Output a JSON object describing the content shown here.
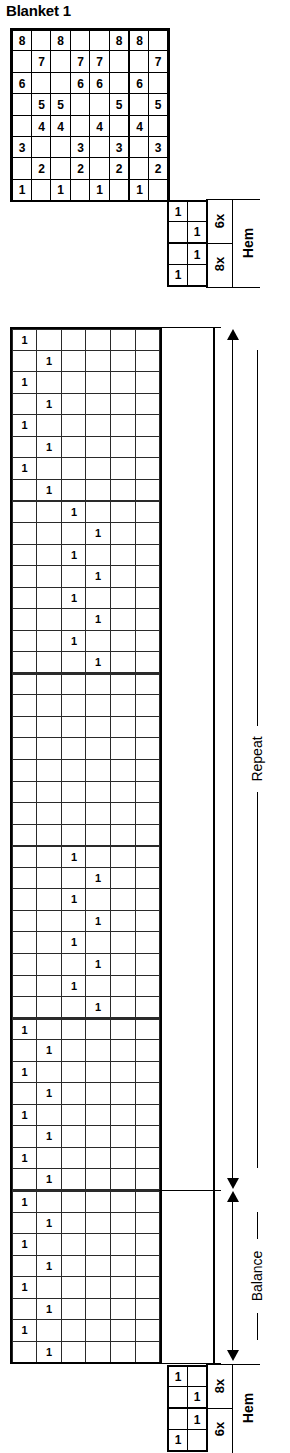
{
  "title": "Blanket 1",
  "colors": {
    "white": "#ffffff",
    "light_grey": "#cbcbcb",
    "dark_grey": "#6d6d6d",
    "black": "#1b1b1b",
    "line": "#000000"
  },
  "threading": {
    "name": "threading-draft",
    "columns": 8,
    "rows": 8,
    "shaft_labels": [
      "8",
      "7",
      "6",
      "5",
      "4",
      "3",
      "2",
      "1"
    ],
    "grid": [
      [
        "8",
        "",
        "8",
        "",
        "",
        "8",
        "8",
        ""
      ],
      [
        "",
        "7",
        "",
        "7",
        "7",
        "",
        "",
        "7"
      ],
      [
        "6",
        "",
        "",
        "6",
        "6",
        "",
        "6",
        ""
      ],
      [
        "",
        "5",
        "5",
        "",
        "",
        "5",
        "",
        "5"
      ],
      [
        "",
        "4",
        "4",
        "",
        "4",
        "",
        "4",
        ""
      ],
      [
        "3",
        "",
        "",
        "3",
        "",
        "3",
        "",
        "3"
      ],
      [
        "",
        "2",
        "",
        "2",
        "",
        "2",
        "",
        "2"
      ],
      [
        "1",
        "",
        "1",
        "",
        "1",
        "",
        "1",
        ""
      ]
    ]
  },
  "hem_top": {
    "name": "hem-top",
    "label": "Hem",
    "repeat_upper": "6x",
    "repeat_lower": "8x",
    "rows": [
      {
        "col7": "1",
        "col8": ""
      },
      {
        "col7": "",
        "col8": "1"
      },
      {
        "col7": "",
        "col8": "1"
      },
      {
        "col7": "1",
        "col8": ""
      }
    ]
  },
  "hem_bottom": {
    "name": "hem-bottom",
    "label": "Hem",
    "repeat_upper": "8x",
    "repeat_lower": "6x",
    "rows": [
      {
        "col7": "1",
        "col8": ""
      },
      {
        "col7": "",
        "col8": "1"
      },
      {
        "col7": "",
        "col8": "1"
      },
      {
        "col7": "1",
        "col8": ""
      }
    ]
  },
  "treadling": {
    "name": "treadling-draft",
    "columns": 6,
    "total_rows": 48,
    "repeat_label": "Repeat",
    "balance_label": "Balance",
    "repeat_rows": 40,
    "balance_rows": 8,
    "mark": "1",
    "blocks": [
      {
        "name": "block-1-light-grey",
        "color": "light_grey",
        "cols": [
          1,
          2
        ],
        "rows": 8,
        "section": "repeat"
      },
      {
        "name": "block-2-dark-grey",
        "color": "dark_grey",
        "cols": [
          3,
          4
        ],
        "rows": 8,
        "section": "repeat"
      },
      {
        "name": "block-3-black",
        "color": "black",
        "cols": [
          5,
          6
        ],
        "rows": 8,
        "section": "repeat"
      },
      {
        "name": "block-4-dark-grey",
        "color": "dark_grey",
        "cols": [
          3,
          4
        ],
        "rows": 8,
        "section": "repeat"
      },
      {
        "name": "block-5-light-grey",
        "color": "light_grey",
        "cols": [
          1,
          2
        ],
        "rows": 8,
        "section": "repeat"
      },
      {
        "name": "block-6-light-grey",
        "color": "light_grey",
        "cols": [
          1,
          2
        ],
        "rows": 8,
        "section": "balance"
      }
    ]
  }
}
